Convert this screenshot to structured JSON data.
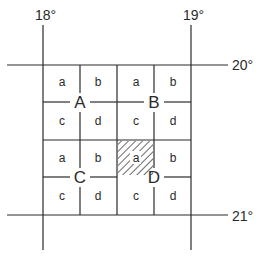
{
  "diagram": {
    "longitude_labels": [
      "18°",
      "19°"
    ],
    "latitude_labels": [
      "20°",
      "21°"
    ],
    "quadrants": [
      {
        "label": "A",
        "cells": [
          "a",
          "b",
          "c",
          "d"
        ]
      },
      {
        "label": "B",
        "cells": [
          "a",
          "b",
          "c",
          "d"
        ]
      },
      {
        "label": "C",
        "cells": [
          "a",
          "b",
          "c",
          "d"
        ]
      },
      {
        "label": "D",
        "cells": [
          "a",
          "b",
          "c",
          "d"
        ]
      }
    ],
    "highlighted_cell": {
      "quadrant": "D",
      "cell": "a",
      "style": "diagonal-hatch"
    },
    "colors": {
      "line": "#2a2a2a",
      "background": "#ffffff"
    }
  }
}
